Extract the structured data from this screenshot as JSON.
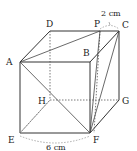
{
  "figure": {
    "type": "cube",
    "vertices": {
      "A": {
        "label": "A",
        "x": 20,
        "y": 62
      },
      "B": {
        "label": "B",
        "x": 90,
        "y": 62
      },
      "C": {
        "label": "C",
        "x": 119,
        "y": 31
      },
      "D": {
        "label": "D",
        "x": 50,
        "y": 31
      },
      "E": {
        "label": "E",
        "x": 20,
        "y": 133
      },
      "F": {
        "label": "F",
        "x": 90,
        "y": 133
      },
      "G": {
        "label": "G",
        "x": 119,
        "y": 100
      },
      "H": {
        "label": "H",
        "x": 50,
        "y": 100
      },
      "P": {
        "label": "P",
        "x": 100,
        "y": 31
      }
    },
    "dimensions": {
      "edge": "6 cm",
      "pc": "2 cm"
    },
    "colors": {
      "line": "#333333",
      "text": "#222222"
    }
  }
}
